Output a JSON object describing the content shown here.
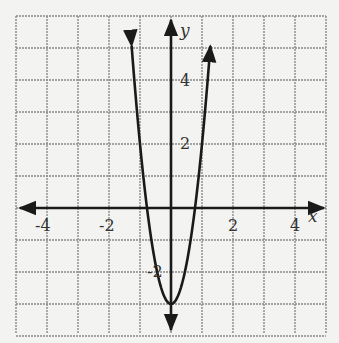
{
  "chart_data": {
    "type": "line",
    "title": "",
    "xlabel": "x",
    "ylabel": "y",
    "xlim": [
      -5,
      5
    ],
    "ylim": [
      -4,
      6
    ],
    "grid": true,
    "grid_step": 1,
    "x_ticks": [
      -4,
      -2,
      2,
      4
    ],
    "y_ticks": [
      4,
      2,
      -2
    ],
    "x_tick_labels": [
      "-4",
      "-2",
      "2",
      "4"
    ],
    "y_tick_labels": [
      "4",
      "2",
      "-2"
    ],
    "series": [
      {
        "name": "parabola",
        "equation": "y = 5x^2 - 3",
        "vertex": [
          0,
          -3
        ],
        "x_intercepts": [
          -0.77,
          0.77
        ],
        "x": [
          -1.27,
          -1.0,
          -0.77,
          -0.5,
          0,
          0.5,
          0.77,
          1.0,
          1.27
        ],
        "y": [
          5.06,
          2,
          0,
          -1.75,
          -3,
          -1.75,
          0,
          2,
          5.06
        ],
        "arrows_at_ends": true,
        "color": "#1a1a1a"
      }
    ],
    "axes_arrows": true
  },
  "labels": {
    "x_axis": "x",
    "y_axis": "y",
    "xt0": "-4",
    "xt1": "-2",
    "xt2": "2",
    "xt3": "4",
    "yt0": "4",
    "yt1": "2",
    "yt2": "-2"
  }
}
